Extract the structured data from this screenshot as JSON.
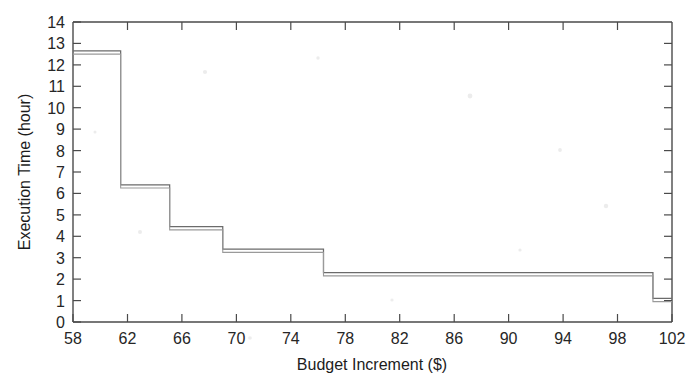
{
  "figure": {
    "name": "execution-time-vs-budget-increment-step-chart",
    "background_color": "#ffffff",
    "line_color": "#6b6b6b",
    "axis_color": "#4a4a4a",
    "text_color": "#262626"
  },
  "chart_data": {
    "type": "line",
    "title": "",
    "subtitle": "",
    "xlabel": "Budget Increment ($)",
    "ylabel": "Execution Time (hour)",
    "xlim": [
      58,
      102
    ],
    "ylim": [
      0,
      14
    ],
    "xticks": [
      58,
      62,
      66,
      70,
      74,
      78,
      82,
      86,
      90,
      94,
      98,
      102
    ],
    "yticks": [
      0,
      1,
      2,
      3,
      4,
      5,
      6,
      7,
      8,
      9,
      10,
      11,
      12,
      13,
      14
    ],
    "xtick_labels": [
      "58",
      "62",
      "66",
      "70",
      "74",
      "78",
      "82",
      "86",
      "90",
      "94",
      "98",
      "102"
    ],
    "ytick_labels": [
      "0",
      "1",
      "2",
      "3",
      "4",
      "5",
      "6",
      "7",
      "8",
      "9",
      "10",
      "11",
      "12",
      "13",
      "14"
    ],
    "grid": false,
    "legend": false,
    "legend_position": "none",
    "interpolation": "step-post",
    "annotations": [],
    "series": [
      {
        "name": "Execution Time",
        "style": "step",
        "color": "#6b6b6b",
        "x": [
          58,
          61.5,
          65.1,
          69.0,
          76.4,
          100.6,
          102
        ],
        "values": [
          12.65,
          6.4,
          4.45,
          3.4,
          2.3,
          1.1,
          1.1
        ],
        "steps": [
          {
            "x_start": 58,
            "x_end": 61.5,
            "y": 12.65
          },
          {
            "x_start": 61.5,
            "x_end": 65.1,
            "y": 6.4
          },
          {
            "x_start": 65.1,
            "x_end": 69.0,
            "y": 4.45
          },
          {
            "x_start": 69.0,
            "x_end": 76.4,
            "y": 3.4
          },
          {
            "x_start": 76.4,
            "x_end": 100.6,
            "y": 2.3
          },
          {
            "x_start": 100.6,
            "x_end": 102,
            "y": 1.1
          }
        ]
      }
    ]
  },
  "axes": {
    "x_axis_label": "Budget Increment ($)",
    "y_axis_label": "Execution Time (hour)"
  }
}
